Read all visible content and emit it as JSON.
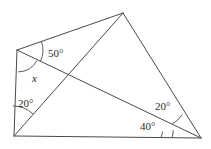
{
  "figure": {
    "type": "geometry-diagram",
    "width": 211,
    "height": 149,
    "stroke_color": "#4a4a4a",
    "text_color": "#2b2b2b",
    "background_color": "#ffffff",
    "stroke_width": 1,
    "vertices": {
      "left": {
        "name": "left-vertex",
        "x": 17,
        "y": 50
      },
      "top": {
        "name": "top-apex-vertex",
        "x": 123,
        "y": 13
      },
      "bottom_left": {
        "name": "bottom-left-vertex",
        "x": 14,
        "y": 136
      },
      "bottom_right": {
        "name": "bottom-right-vertex",
        "x": 201,
        "y": 138
      },
      "intersection": {
        "name": "diagonal-intersection",
        "x": 68,
        "y": 78
      }
    },
    "edges": [
      {
        "name": "edge-left-to-top",
        "from": "left",
        "to": "top"
      },
      {
        "name": "edge-top-to-bottom-right",
        "from": "top",
        "to": "bottom_right"
      },
      {
        "name": "edge-bottom",
        "from": "bottom_left",
        "to": "bottom_right"
      },
      {
        "name": "edge-left-side",
        "from": "left",
        "to": "bottom_left"
      },
      {
        "name": "diagonal-left-to-bottom-right",
        "from": "left",
        "to": "bottom_right"
      },
      {
        "name": "diagonal-bottom-left-to-top",
        "from": "bottom_left",
        "to": "top"
      }
    ],
    "angles": [
      {
        "id": "angle-50",
        "label": "50°",
        "value": 50,
        "unit": "degrees",
        "vertex": "left",
        "label_x": 48,
        "label_y": 48,
        "arc_radius": 26
      },
      {
        "id": "angle-x",
        "label": "x",
        "value": null,
        "unit": "unknown",
        "vertex": "left",
        "label_x": 32,
        "label_y": 73,
        "arc_radius": 22,
        "italic": true
      },
      {
        "id": "angle-20-left",
        "label": "20°",
        "value": 20,
        "unit": "degrees",
        "vertex": "bottom_left",
        "label_x": 18,
        "label_y": 98,
        "arc_radius": 30
      },
      {
        "id": "angle-20-right",
        "label": "20°",
        "value": 20,
        "unit": "degrees",
        "vertex": "bottom_right",
        "label_x": 155,
        "label_y": 101,
        "arc_radius": 30
      },
      {
        "id": "angle-40",
        "label": "40°",
        "value": 40,
        "unit": "degrees",
        "vertex": "bottom_right",
        "label_x": 140,
        "label_y": 121,
        "arc_radius": 40
      }
    ]
  }
}
